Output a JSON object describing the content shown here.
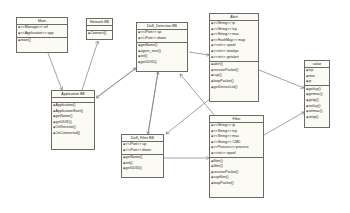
{
  "classes": {
    "main": {
      "name": "Main",
      "attributes": [
        "<<Manager>> wf",
        "<<Application>> app"
      ],
      "methods": [
        "main()"
      ]
    },
    "network": {
      "name": "Network BB",
      "attributes": [],
      "methods": [
        "Connect()"
      ]
    },
    "application": {
      "name": "Application BB",
      "attributes": [],
      "methods": [
        "Application()",
        "ApplicationStart()",
        "getName()",
        "getUUID()",
        "OnReceive()",
        "OnConnected()"
      ]
    },
    "dos_detection": {
      "name": "DoS_Detection BB",
      "attributes": [
        "<<iPort>> up",
        "<<iPort>> down"
      ],
      "methods": [
        "getName()",
        "agent_start()",
        "init()",
        "getUUID()"
      ]
    },
    "alert": {
      "name": "Alert",
      "attributes": [
        "<<String>> ip",
        "<<String>> tcp",
        "<<String>> mac",
        "<<HashMap>> map",
        "<<int>> spoof",
        "<<int>> totalspc",
        "<<int>> getalert"
      ],
      "methods": [
        "alert()",
        "receivePacket()",
        "cap()",
        "loopPacket()",
        "getDeviceList()"
      ]
    },
    "value": {
      "name": "value",
      "attributes": [
        "tcp",
        "mac",
        "ip"
      ],
      "methods": [
        "getIcp()",
        "getmac()",
        "getip()",
        "setIcp()",
        "setmac()",
        "setip()"
      ]
    },
    "dos_filter": {
      "name": "DoS_Filter BB",
      "attributes": [
        "<<iPort>> up",
        "<<iPort>> down"
      ],
      "methods": [
        "getName()",
        "init()",
        "getUUID()"
      ]
    },
    "filter": {
      "name": "Filter",
      "attributes": [
        "<<String>> ip",
        "<<String>> tcp",
        "<<String>> mac",
        "<<String>> CMD",
        "<<Process>> process",
        "<<int>> spoof"
      ],
      "methods": [
        "filter()",
        "filter()",
        "receivePacket()",
        "capfilter()",
        "loopPacket()"
      ]
    }
  }
}
